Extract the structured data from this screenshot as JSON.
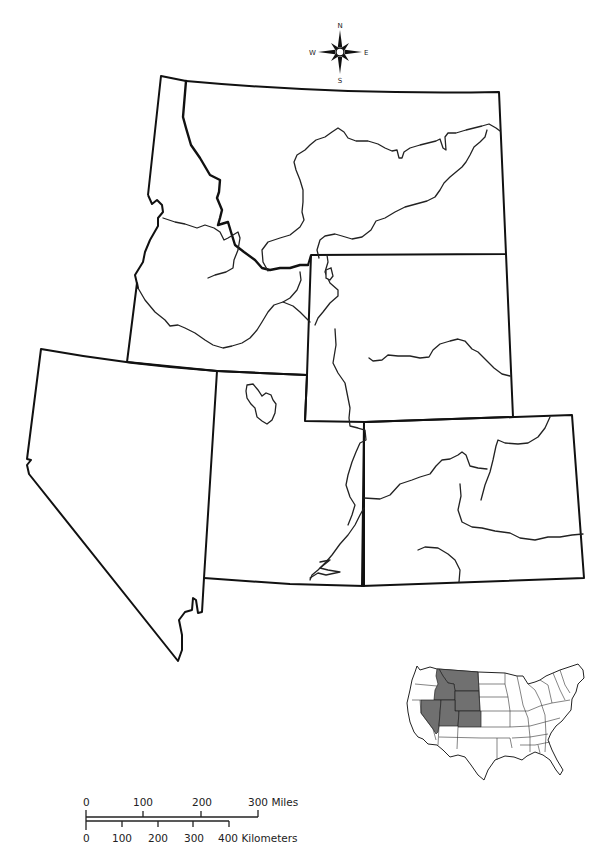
{
  "map": {
    "type": "outline map",
    "region": "Mountain West",
    "states_shown": [
      "Idaho",
      "Montana",
      "Wyoming",
      "Nevada",
      "Utah",
      "Colorado"
    ],
    "state_labels_visible": false
  },
  "compass": {
    "north": "N",
    "south": "S",
    "east": "E",
    "west": "W",
    "icon": "compass-rose-icon"
  },
  "scale_bar": {
    "miles": {
      "ticks": [
        "0",
        "100",
        "200",
        "300 Miles"
      ]
    },
    "kilometers": {
      "ticks": [
        "0",
        "100",
        "200",
        "300",
        "400 Kilometers"
      ]
    }
  },
  "locator_inset": {
    "description": "Contiguous United States locator map",
    "highlight_color": "#707070",
    "highlighted_states": [
      "Idaho",
      "Montana",
      "Wyoming",
      "Nevada",
      "Utah",
      "Colorado"
    ]
  },
  "colors": {
    "line": "#111111",
    "background": "#ffffff",
    "highlight": "#707070"
  }
}
